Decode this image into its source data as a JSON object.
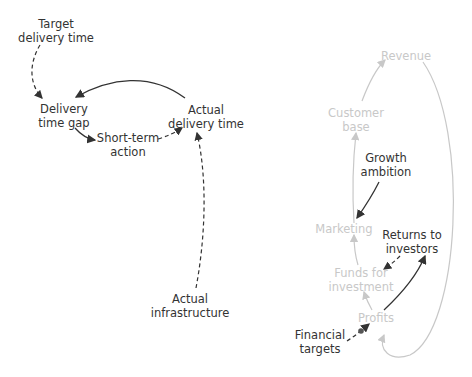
{
  "colors": {
    "dark": "#333333",
    "light": "#c8c8c8",
    "background": "#ffffff"
  },
  "left_diagram": {
    "nodes": [
      {
        "id": "target-delivery-time",
        "lines": [
          "Target",
          "delivery time"
        ]
      },
      {
        "id": "delivery-time-gap",
        "lines": [
          "Delivery",
          "time gap"
        ]
      },
      {
        "id": "actual-delivery-time",
        "lines": [
          "Actual",
          "delivery time"
        ]
      },
      {
        "id": "short-term-action",
        "lines": [
          "Short-term",
          "action"
        ]
      },
      {
        "id": "actual-infrastructure",
        "lines": [
          "Actual",
          "infrastructure"
        ]
      }
    ]
  },
  "right_diagram": {
    "nodes": [
      {
        "id": "revenue",
        "lines": [
          "Revenue"
        ],
        "style": "light"
      },
      {
        "id": "customer-base",
        "lines": [
          "Customer",
          "base"
        ],
        "style": "light"
      },
      {
        "id": "growth-ambition",
        "lines": [
          "Growth",
          "ambition"
        ],
        "style": "dark"
      },
      {
        "id": "marketing",
        "lines": [
          "Marketing"
        ],
        "style": "light"
      },
      {
        "id": "returns-to-investors",
        "lines": [
          "Returns to",
          "investors"
        ],
        "style": "dark"
      },
      {
        "id": "funds-for-investment",
        "lines": [
          "Funds for",
          "investment"
        ],
        "style": "light"
      },
      {
        "id": "profits",
        "lines": [
          "Profits"
        ],
        "style": "light"
      },
      {
        "id": "financial-targets",
        "lines": [
          "Financial",
          "targets"
        ],
        "style": "dark"
      }
    ]
  }
}
